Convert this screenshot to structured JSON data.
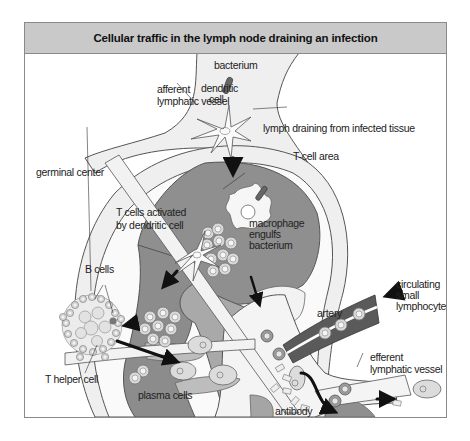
{
  "title": "Cellular traffic in the lymph node draining an infection",
  "labels": {
    "bacterium": "bacterium",
    "dendritic_cell_1": "dendritic",
    "dendritic_cell_2": "cell",
    "afferent_1": "afferent",
    "afferent_2": "lymphatic vessel",
    "lymph_draining": "lymph draining from infected tissue",
    "t_cell_area": "T-cell area",
    "germinal_center": "germinal center",
    "t_cells_activated_1": "T cells activated",
    "t_cells_activated_2": "by dendritic cell",
    "macrophage_1": "macrophage",
    "macrophage_2": "engulfs",
    "macrophage_3": "bacterium",
    "b_cells": "B cells",
    "t_helper_cell": "T helper cell",
    "plasma_cells": "plasma cells",
    "artery": "artery",
    "circulating_1": "circulating",
    "circulating_2": "small",
    "circulating_3": "lymphocytes",
    "efferent_1": "efferent",
    "efferent_2": "lymphatic vessel",
    "antibody": "antibody"
  },
  "colors": {
    "title_bar": "#c9c9c9",
    "frame_border": "#8a8a8a",
    "capsule_fill": "#efefef",
    "t_cell_area": "#8f8f8f",
    "medulla": "#a9a9a9",
    "cortex_light": "#f4f4f4",
    "artery": "#5a5a5a",
    "arrow": "#111111"
  }
}
